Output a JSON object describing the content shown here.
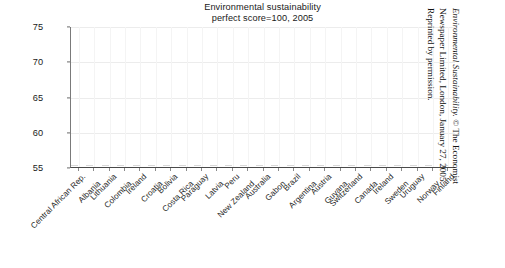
{
  "chart_data": {
    "type": "scatter",
    "title": "Environmental sustainability perfect score=100, 2005",
    "title_lines": [
      "Environmental sustainability",
      "perfect score=100, 2005"
    ],
    "xlabel": "",
    "ylabel": "",
    "ylim": [
      55,
      75
    ],
    "yticks": [
      55,
      60,
      65,
      70,
      75
    ],
    "grid": true,
    "legend": null,
    "note": "No data markers are rendered within the visible 55-75 range; the plotted series lies below the axis minimum and is clipped.",
    "categories": [
      "Central African Rep.",
      "Albania",
      "Lithuania",
      "Colombia",
      "Ireland",
      "Croatia",
      "Bolivia",
      "Costa Rica",
      "Paraguay",
      "Latvia",
      "Peru",
      "New Zealand",
      "Australia",
      "Gabon",
      "Brazil",
      "Argentina",
      "Austria",
      "Guyana",
      "Switzerland",
      "Canada",
      "Ireland",
      "Sweden",
      "Uruguay",
      "Norway",
      "Finland"
    ],
    "values": [
      null,
      null,
      null,
      null,
      null,
      null,
      null,
      null,
      null,
      null,
      null,
      null,
      null,
      null,
      null,
      null,
      null,
      null,
      null,
      null,
      null,
      null,
      null,
      null,
      null
    ]
  },
  "credit": {
    "italic_part": "Environmental Sustainability.",
    "line1_rest": " © The Economist",
    "line2": "Newspaper Limited, London, January 27, 2005.",
    "line3": "Reprinted by permission."
  },
  "colors": {
    "background": "#ffffff",
    "axis": "#4a4a4a",
    "gridline": "#ececec",
    "text": "#1a1a1a",
    "marker": "#333333"
  }
}
